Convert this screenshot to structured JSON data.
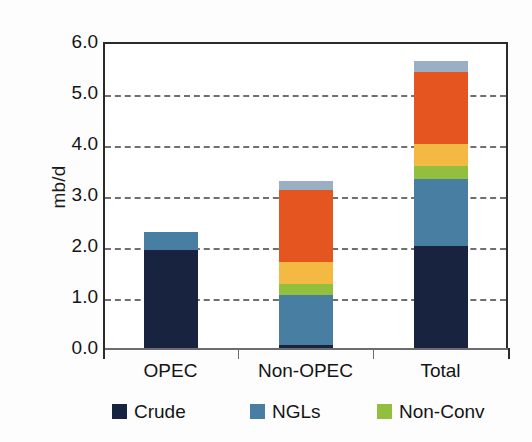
{
  "chart_data": {
    "type": "bar",
    "subtype": "stacked-bar",
    "title": "",
    "xlabel": "",
    "ylabel": "mb/d",
    "ylim": [
      0.0,
      6.0
    ],
    "ytick_step": 1.0,
    "ytick_labels": [
      "6.0",
      "5.0",
      "4.0",
      "3.0",
      "2.0",
      "1.0",
      "0.0"
    ],
    "ytick_values": [
      6.0,
      5.0,
      4.0,
      3.0,
      2.0,
      1.0,
      0.0
    ],
    "grid": "horizontal-dashed",
    "legend_position": "bottom",
    "categories": [
      "OPEC",
      "Non-OPEC",
      "Total"
    ],
    "series": [
      {
        "name": "Crude",
        "color": "#17233f",
        "values": [
          1.93,
          0.05,
          2.0
        ]
      },
      {
        "name": "NGLs",
        "color": "#487ea1",
        "values": [
          0.35,
          0.98,
          1.32
        ]
      },
      {
        "name": "Non-Conv",
        "color": "#92c03e",
        "values": [
          0.0,
          0.23,
          0.25
        ]
      },
      {
        "name": "Series4",
        "color": "#f4b942",
        "values": [
          0.0,
          0.42,
          0.43
        ]
      },
      {
        "name": "Series5",
        "color": "#e4551f",
        "values": [
          0.0,
          1.42,
          1.42
        ]
      },
      {
        "name": "Series6",
        "color": "#9aaec4",
        "values": [
          0.0,
          0.18,
          0.2
        ]
      }
    ],
    "category_totals": [
      2.28,
      3.28,
      5.62
    ],
    "legend_entries": [
      {
        "label": "Crude",
        "color": "#17233f"
      },
      {
        "label": "NGLs",
        "color": "#487ea1"
      },
      {
        "label": "Non-Conv",
        "color": "#92c03e"
      }
    ]
  },
  "axis": {
    "y_title": "mb/d"
  }
}
